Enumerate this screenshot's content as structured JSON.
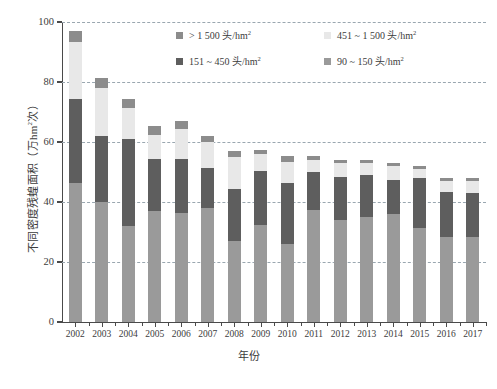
{
  "chart_data": {
    "type": "bar",
    "stacked": true,
    "title": "",
    "xlabel": "年份",
    "ylabel": "不同密度残蝗面积（万hm²次）",
    "ylabel_main": "不同密度残蝗面积（万hm",
    "ylabel_sup": "2",
    "ylabel_tail": "次）",
    "ylim": [
      0,
      100
    ],
    "yticks": [
      0,
      20,
      40,
      60,
      80,
      100
    ],
    "ytick_labels": [
      "0",
      "20",
      "40",
      "60",
      "80",
      "100"
    ],
    "grid": "horizontal-dashed",
    "legend_position": "top-center-inside",
    "categories": [
      "2002",
      "2003",
      "2004",
      "2005",
      "2006",
      "2007",
      "2008",
      "2009",
      "2010",
      "2011",
      "2012",
      "2013",
      "2014",
      "2015",
      "2016",
      "2017"
    ],
    "series": [
      {
        "name": "90 ~ 150 头/hm²",
        "color": "#9a9a9a",
        "values": [
          46.5,
          40.0,
          32.0,
          37.0,
          36.5,
          38.0,
          27.0,
          32.5,
          26.0,
          37.5,
          34.0,
          35.0,
          36.0,
          31.5,
          28.5,
          28.5
        ]
      },
      {
        "name": "151 ~ 450 头/hm²",
        "color": "#5e5e5e",
        "values": [
          28.0,
          22.0,
          29.0,
          17.5,
          18.0,
          13.5,
          17.5,
          18.0,
          20.5,
          12.5,
          14.5,
          14.0,
          11.5,
          16.5,
          15.0,
          14.5
        ]
      },
      {
        "name": "451 ~ 1 500 头/hm²",
        "color": "#e8e8e8",
        "values": [
          19.0,
          16.0,
          10.5,
          8.0,
          10.0,
          8.5,
          10.5,
          5.5,
          7.0,
          4.0,
          4.5,
          4.0,
          4.5,
          3.0,
          3.5,
          4.0
        ]
      },
      {
        "name": "> 1 500 头/hm²",
        "color": "#8c8c8c",
        "values": [
          3.5,
          3.5,
          3.0,
          3.0,
          2.5,
          2.0,
          2.0,
          1.5,
          2.0,
          1.5,
          1.0,
          1.0,
          1.0,
          1.0,
          1.0,
          1.0
        ]
      }
    ],
    "totals": [
      97.0,
      81.5,
      74.5,
      65.5,
      67.0,
      62.0,
      57.0,
      57.5,
      55.5,
      55.5,
      54.0,
      54.0,
      53.0,
      52.0,
      48.0,
      48.0
    ]
  },
  "legend": {
    "items": [
      {
        "label_main": "> 1 500 头/hm",
        "label_sup": "2",
        "color": "#8c8c8c",
        "name": "legend-gt-1500"
      },
      {
        "label_main": "451 ~ 1 500 头/hm",
        "label_sup": "2",
        "color": "#e8e8e8",
        "name": "legend-451-1500"
      },
      {
        "label_main": "151 ~ 450 头/hm",
        "label_sup": "2",
        "color": "#5e5e5e",
        "name": "legend-151-450"
      },
      {
        "label_main": "90 ~ 150 头/hm",
        "label_sup": "2",
        "color": "#9a9a9a",
        "name": "legend-90-150"
      }
    ]
  },
  "colors": {
    "axis": "#4a4a4a",
    "grid": "#9aa7b0",
    "text": "#3c3c3c",
    "background": "#ffffff"
  },
  "caption": ""
}
